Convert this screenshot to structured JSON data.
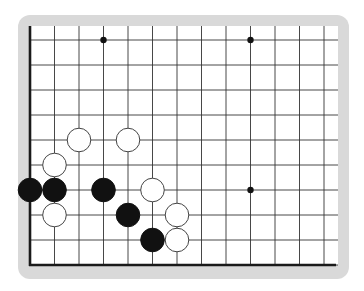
{
  "diagram": {
    "type": "go-board-fragment",
    "frame_color": "#d9d9d9",
    "board_color": "#ffffff",
    "line_color": "#333333",
    "edge_color": "#1a1a1a",
    "columns_x": [
      30,
      54.5,
      79,
      103.5,
      128,
      152.5,
      177,
      201.5,
      226,
      250.5,
      275,
      299.5,
      324
    ],
    "rows_y": [
      40,
      65,
      90,
      115,
      140,
      165,
      190,
      215,
      240,
      265
    ],
    "edges": {
      "left": true,
      "bottom": true,
      "top": false,
      "right": false
    },
    "hoshi": [
      {
        "col": 3,
        "row": 0
      },
      {
        "col": 9,
        "row": 0
      },
      {
        "col": 9,
        "row": 6
      }
    ],
    "stones": [
      {
        "color": "white",
        "col": 2,
        "row": 4
      },
      {
        "color": "white",
        "col": 4,
        "row": 4
      },
      {
        "color": "white",
        "col": 1,
        "row": 5
      },
      {
        "color": "black",
        "col": 0,
        "row": 6
      },
      {
        "color": "black",
        "col": 1,
        "row": 6
      },
      {
        "color": "black",
        "col": 3,
        "row": 6
      },
      {
        "color": "white",
        "col": 5,
        "row": 6
      },
      {
        "color": "white",
        "col": 1,
        "row": 7
      },
      {
        "color": "black",
        "col": 4,
        "row": 7
      },
      {
        "color": "white",
        "col": 6,
        "row": 7
      },
      {
        "color": "black",
        "col": 5,
        "row": 8
      },
      {
        "color": "white",
        "col": 6,
        "row": 8
      }
    ]
  }
}
